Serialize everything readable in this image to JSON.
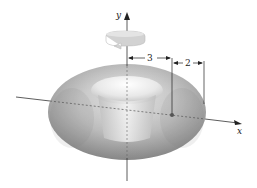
{
  "figure": {
    "axes": {
      "x_label": "x",
      "y_label": "y"
    },
    "dimensions": [
      {
        "label": "3",
        "meaning": "distance from y-axis to circle center"
      },
      {
        "label": "2",
        "meaning": "radius of rotated circle"
      }
    ],
    "colors": {
      "torus_light": "#f2f2f2",
      "torus_mid": "#c4c4c4",
      "torus_dark": "#8e8e8e",
      "axis": "#333333",
      "rotation_arrow": "#cfcfcf"
    },
    "icons": {
      "rotation": "rotation-arrow-icon"
    }
  }
}
